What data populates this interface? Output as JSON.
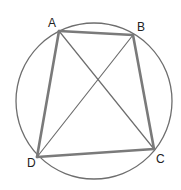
{
  "diagram": {
    "type": "cyclic-quadrilateral",
    "circle": {
      "cx": 94,
      "cy": 101,
      "r": 78
    },
    "points": [
      {
        "id": "A",
        "label": "A",
        "x": 59,
        "y": 31,
        "label_x": 48,
        "label_y": 27
      },
      {
        "id": "B",
        "label": "B",
        "x": 133,
        "y": 35,
        "label_x": 137,
        "label_y": 31
      },
      {
        "id": "C",
        "label": "C",
        "x": 154,
        "y": 149,
        "label_x": 156,
        "label_y": 163
      },
      {
        "id": "D",
        "label": "D",
        "x": 37,
        "y": 157,
        "label_x": 27,
        "label_y": 167
      }
    ],
    "sides": [
      [
        "A",
        "B"
      ],
      [
        "B",
        "C"
      ],
      [
        "C",
        "D"
      ],
      [
        "D",
        "A"
      ]
    ],
    "diagonals": [
      [
        "A",
        "C"
      ],
      [
        "B",
        "D"
      ]
    ],
    "colors": {
      "circle": "#6e6e6e",
      "sides": "#7a7a7a",
      "diagonals": "#6e6e6e",
      "labels": "#222222"
    }
  }
}
